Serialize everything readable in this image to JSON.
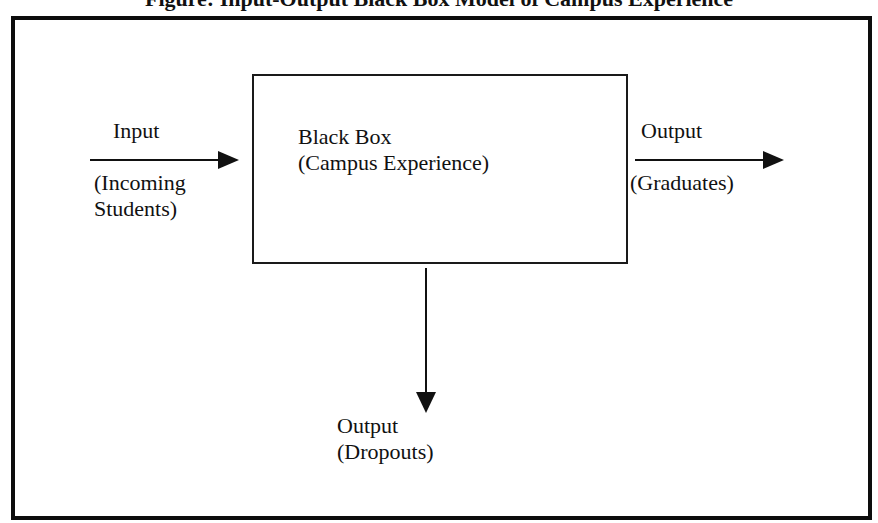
{
  "title": "Figure: Input-Output Black Box Model of Campus Experience",
  "diagram": {
    "input": {
      "heading": "Input",
      "line1": "(Incoming",
      "line2": "Students)"
    },
    "black_box": {
      "heading": "Black Box",
      "subheading": "(Campus Experience)"
    },
    "output_right": {
      "heading": "Output",
      "subheading": "(Graduates)"
    },
    "output_down": {
      "heading": "Output",
      "subheading": "(Dropouts)"
    },
    "colors": {
      "stroke": "#111111",
      "background": "#ffffff"
    }
  }
}
